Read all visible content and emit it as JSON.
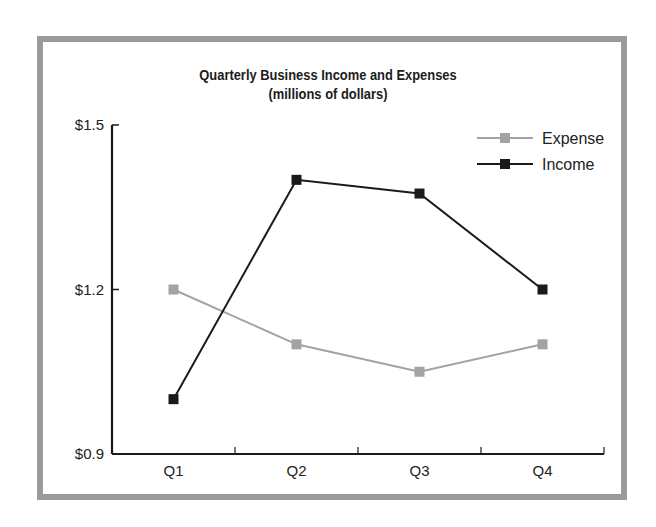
{
  "chart_data": {
    "type": "line",
    "title": "Quarterly Business Income and Expenses",
    "subtitle": "(millions of dollars)",
    "xlabel": "",
    "ylabel": "",
    "categories": [
      "Q1",
      "Q2",
      "Q3",
      "Q4"
    ],
    "series": [
      {
        "name": "Expense",
        "color": "#a3a3a3",
        "values": [
          1.2,
          1.1,
          1.05,
          1.1
        ]
      },
      {
        "name": "Income",
        "color": "#1a1a1a",
        "values": [
          1.0,
          1.4,
          1.375,
          1.2
        ]
      }
    ],
    "ylim": [
      0.9,
      1.5
    ],
    "yticks": [
      0.9,
      1.2,
      1.5
    ],
    "ytick_labels": [
      "$0.9",
      "$1.2",
      "$1.5"
    ],
    "grid": false,
    "legend_position": "top-right",
    "marker": "square"
  },
  "frame": {
    "border_color": "#9a9a9a"
  }
}
